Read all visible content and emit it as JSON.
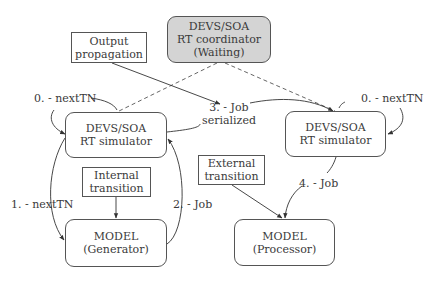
{
  "diagram": {
    "nodes": {
      "output_propagation": {
        "line1": "Output",
        "line2": "propagation"
      },
      "coordinator": {
        "line1": "DEVS/SOA",
        "line2": "RT coordinator",
        "line3": "(Waiting)",
        "fill": "#d4d4d4"
      },
      "left_simulator": {
        "line1": "DEVS/SOA",
        "line2": "RT simulator"
      },
      "right_simulator": {
        "line1": "DEVS/SOA",
        "line2": "RT simulator"
      },
      "internal_transition": {
        "line1": "Internal",
        "line2": "transition"
      },
      "external_transition": {
        "line1": "External",
        "line2": "transition"
      },
      "generator_model": {
        "line1": "MODEL",
        "line2": "(Generator)"
      },
      "processor_model": {
        "line1": "MODEL",
        "line2": "(Processor)"
      }
    },
    "edge_labels": {
      "left_next_tn_0": "0. - nextTN",
      "right_next_tn_0": "0. - nextTN",
      "next_tn_1": "1. - nextTN",
      "job_2": "2. - Job",
      "job_serialized_3_line1": "3. - Job",
      "job_serialized_3_line2": "serialized",
      "job_4": "4. - Job"
    },
    "edges": [
      {
        "from": "coordinator",
        "to": "left_simulator",
        "style": "dashed"
      },
      {
        "from": "coordinator",
        "to": "right_simulator",
        "style": "dashed"
      },
      {
        "from": "output_propagation",
        "to": "job_serialized_label",
        "style": "arrow"
      },
      {
        "from": "left_simulator",
        "to": "right_simulator",
        "label": "3. - Job serialized"
      },
      {
        "from": "left_simulator",
        "to": "generator_model",
        "label": "1. - nextTN"
      },
      {
        "from": "generator_model",
        "to": "left_simulator",
        "label": "2. - Job"
      },
      {
        "from": "internal_transition",
        "to": "generator_model"
      },
      {
        "from": "external_transition",
        "to": "processor_model"
      },
      {
        "from": "right_simulator",
        "to": "processor_model",
        "label": "4. - Job"
      },
      {
        "from": "left_simulator",
        "to": "left_simulator",
        "label": "0. - nextTN"
      },
      {
        "from": "right_simulator",
        "to": "right_simulator",
        "label": "0. - nextTN"
      }
    ]
  }
}
